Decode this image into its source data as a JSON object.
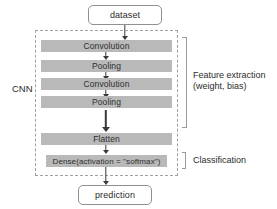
{
  "diagram": {
    "title_text": "CNN architecture flow",
    "group_label": "CNN",
    "input_node": {
      "label": "dataset"
    },
    "output_node": {
      "label": "prediction"
    },
    "layers": [
      {
        "id": "conv1",
        "label": "Convolution"
      },
      {
        "id": "pool1",
        "label": "Pooling"
      },
      {
        "id": "conv2",
        "label": "Convolution"
      },
      {
        "id": "pool2",
        "label": "Pooling"
      },
      {
        "id": "flatten",
        "label": "Flatten"
      },
      {
        "id": "dense",
        "label": "Dense(activation = \"softmax\")"
      }
    ],
    "annotations": {
      "feature_extraction_line1": "Feature extraction",
      "feature_extraction_line2": "(weight, bias)",
      "classification": "Classification"
    },
    "colors": {
      "layer_fill": "#b9b9b9",
      "dashed_border": "#a0a0a0",
      "arrow": "#3a3a3a",
      "text": "#2b2b2b",
      "node_border": "#8f8f8f",
      "background": "#ffffff"
    }
  }
}
